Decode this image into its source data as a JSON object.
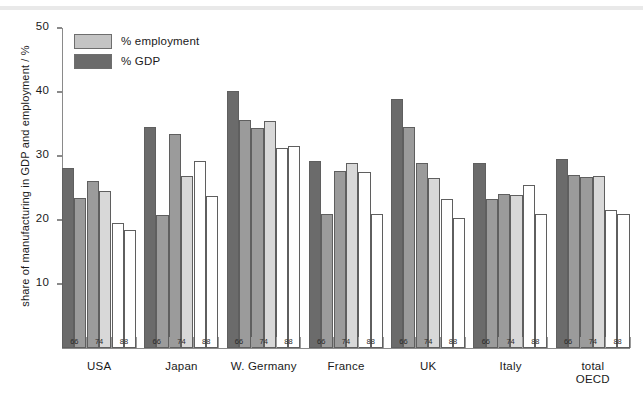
{
  "chart_data": {
    "type": "bar",
    "title": "",
    "xlabel": "",
    "ylabel": "share of manufacturing in GDP and employment / %",
    "ylim": [
      0,
      50
    ],
    "yticks": [
      10,
      20,
      30,
      40,
      50
    ],
    "grid": false,
    "legend_position": "top-left",
    "legend": [
      "% employment",
      "% GDP"
    ],
    "categories": [
      "USA",
      "Japan",
      "W. Germany",
      "France",
      "UK",
      "Italy",
      "total OECD"
    ],
    "subcategories": [
      "66",
      "74",
      "88"
    ],
    "series": [
      {
        "name": "% GDP",
        "color": "#6b6b6b",
        "values_by_group": {
          "USA": [
            28.2,
            26.1,
            19.6
          ],
          "Japan": [
            34.6,
            33.4,
            29.2
          ],
          "W. Germany": [
            40.2,
            34.3,
            31.2
          ],
          "France": [
            29.2,
            27.7,
            27.5
          ],
          "UK": [
            38.9,
            28.9,
            23.3
          ],
          "Italy": [
            28.9,
            24.1,
            25.5
          ],
          "total OECD": [
            29.6,
            26.7,
            21.5
          ]
        }
      },
      {
        "name": "% employment",
        "color": "#c4c4c4",
        "values_by_group": {
          "USA": [
            23.5,
            24.5,
            18.5
          ],
          "Japan": [
            20.8,
            26.8,
            23.7
          ],
          "W. Germany": [
            35.6,
            35.5,
            31.6
          ],
          "France": [
            20.9,
            28.9,
            21.0
          ],
          "UK": [
            34.6,
            26.5,
            20.3
          ],
          "Italy": [
            23.3,
            23.9,
            21.0
          ],
          "total OECD": [
            27.1,
            26.8,
            20.9
          ]
        }
      }
    ]
  },
  "legend": {
    "items": [
      {
        "label": "% employment",
        "color": "#c4c4c4"
      },
      {
        "label": "% GDP",
        "color": "#6b6b6b"
      }
    ]
  },
  "axes": {
    "y_title": "share of manufacturing in GDP and employment / %",
    "y_ticks": [
      "50",
      "40",
      "30",
      "20",
      "10"
    ],
    "year_labels": [
      "66",
      "74",
      "88"
    ]
  },
  "groups": [
    {
      "label": "USA",
      "label2": ""
    },
    {
      "label": "Japan",
      "label2": ""
    },
    {
      "label": "W. Germany",
      "label2": ""
    },
    {
      "label": "France",
      "label2": ""
    },
    {
      "label": "UK",
      "label2": ""
    },
    {
      "label": "Italy",
      "label2": ""
    },
    {
      "label": "total",
      "label2": "OECD"
    }
  ]
}
